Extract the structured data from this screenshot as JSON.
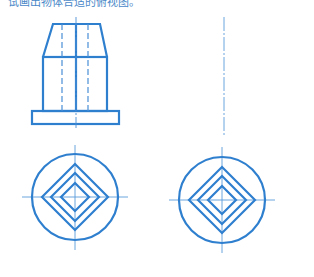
{
  "caption": "试画出物体合适的俯视图。",
  "colors": {
    "line": "#2f7fcf",
    "center": "#5a9ad8"
  },
  "figures": {
    "front_view": {
      "top_edge": [
        [
          53,
          24
        ],
        [
          100,
          24
        ]
      ],
      "shoulder": [
        [
          43,
          57
        ],
        [
          107,
          57
        ]
      ],
      "body_bottom_y": 111,
      "base": {
        "x": 32,
        "y": 111,
        "w": 87,
        "h": 13
      },
      "center_x": 76,
      "hidden_lines_x": [
        62,
        88
      ]
    },
    "top_view_given": {
      "cx": 75,
      "cy": 197,
      "r": 43,
      "diamonds": [
        33,
        24,
        14
      ]
    },
    "top_view_answer": {
      "cx": 222,
      "cy": 200,
      "r": 43,
      "diamonds": [
        33,
        24,
        14
      ]
    },
    "answer_axis": {
      "x": 224,
      "y1": 17,
      "y2": 135
    }
  }
}
